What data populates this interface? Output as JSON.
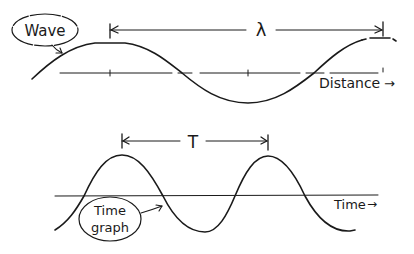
{
  "diagram": {
    "top_panel": {
      "curve_label": "Wave",
      "measure_symbol": "λ",
      "axis_label": "Distance",
      "axis_arrow": "→"
    },
    "bottom_panel": {
      "curve_label_line1": "Time",
      "curve_label_line2": "graph",
      "measure_symbol": "T",
      "axis_label": "Time",
      "axis_arrow": "→"
    },
    "colors": {
      "ink": "#1a1a1a",
      "background": "#ffffff"
    }
  }
}
